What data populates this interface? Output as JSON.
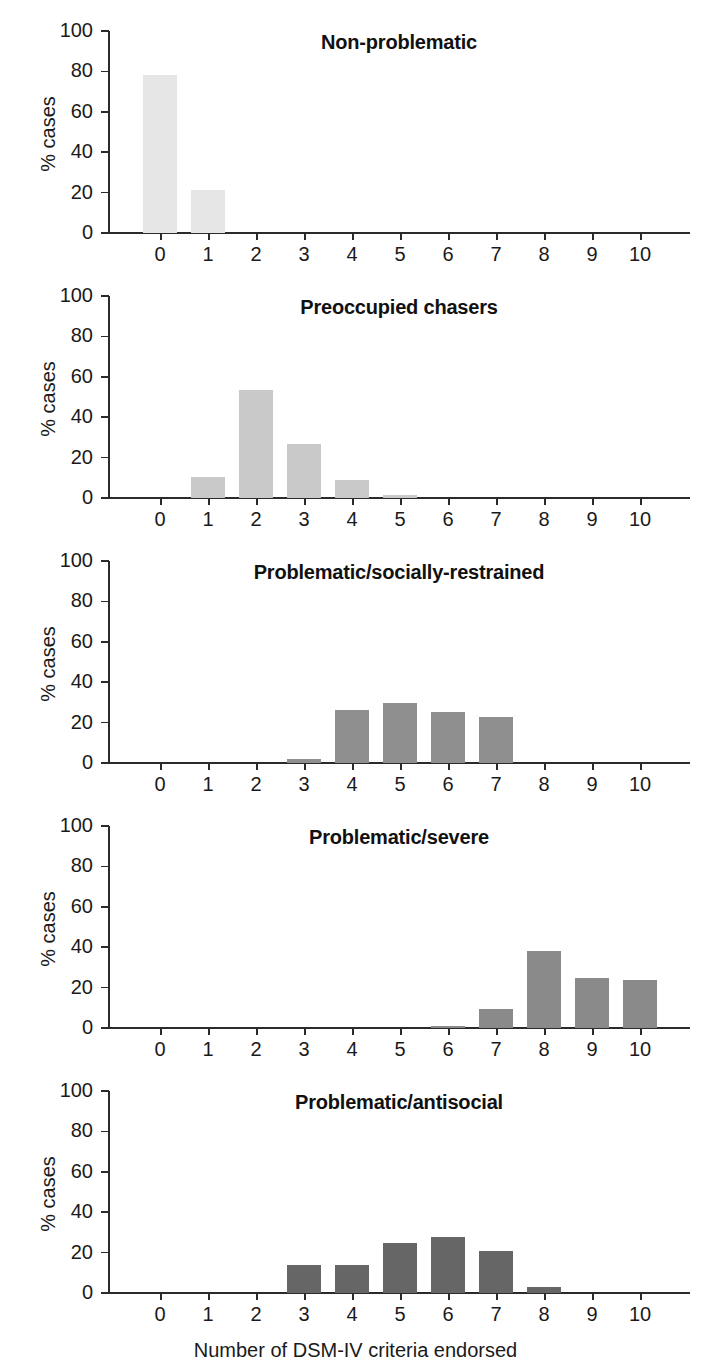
{
  "chart_data": {
    "type": "bar",
    "title": "",
    "xlabel": "Number of DSM-IV criteria endorsed",
    "ylabel": "% cases",
    "categories": [
      "0",
      "1",
      "2",
      "3",
      "4",
      "5",
      "6",
      "7",
      "8",
      "9",
      "10"
    ],
    "xlim": [
      -0.5,
      11.3
    ],
    "ylim": [
      0,
      100
    ],
    "yticks": [
      "0",
      "20",
      "40",
      "60",
      "80",
      "100"
    ],
    "grid": false,
    "legend": "none",
    "layout": "5 stacked panels sharing x axis",
    "panels": [
      {
        "title": "Non-problematic",
        "bar_color": "#e6e6e6",
        "values": [
          78,
          21.5,
          0,
          0,
          0,
          0,
          0,
          0,
          0,
          0,
          0
        ]
      },
      {
        "title": "Preoccupied chasers",
        "bar_color": "#c9c9c9",
        "values": [
          0,
          10.5,
          53.5,
          26.8,
          9,
          1.6,
          0,
          0,
          0,
          0,
          0
        ]
      },
      {
        "title": "Problematic/socially-restrained",
        "bar_color": "#8f8f8f",
        "values": [
          0,
          0,
          0,
          2.2,
          26,
          29.5,
          25.5,
          22.8,
          0,
          0,
          0
        ]
      },
      {
        "title": "Problematic/severe",
        "bar_color": "#8a8a8a",
        "values": [
          0,
          0,
          0,
          0,
          0,
          0,
          0.7,
          9.6,
          38,
          25,
          24
        ]
      },
      {
        "title": "Problematic/antisocial",
        "bar_color": "#666666",
        "values": [
          0,
          0,
          0,
          14,
          14,
          25,
          27.5,
          21,
          3,
          0,
          0
        ]
      }
    ]
  },
  "figure": {
    "axis_color": "#2b2b2b",
    "text_color": "#1a1a1a",
    "background": "#ffffff"
  }
}
